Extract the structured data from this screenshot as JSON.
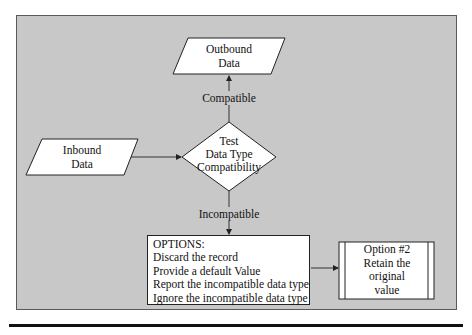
{
  "diagram": {
    "nodes": {
      "outbound": {
        "type": "data-io",
        "lines": [
          "Outbound",
          "Data"
        ]
      },
      "inbound": {
        "type": "data-io",
        "lines": [
          "Inbound",
          "Data"
        ]
      },
      "decision": {
        "type": "decision",
        "lines": [
          "Test",
          "Data Type",
          "Compatibility"
        ]
      },
      "options": {
        "type": "process",
        "title": "OPTIONS:",
        "items": [
          "Discard the record",
          "Provide a default Value",
          "Report the incompatible data type",
          "Ignore the incompatible data type"
        ]
      },
      "option2": {
        "type": "predefined-process",
        "lines": [
          "Option #2",
          "Retain the",
          "original",
          "value"
        ]
      }
    },
    "edges": {
      "compatible": {
        "from": "decision",
        "to": "outbound",
        "label": "Compatible"
      },
      "incompatible": {
        "from": "decision",
        "to": "options",
        "label": "Incompatible"
      },
      "inbound_to_decision": {
        "from": "inbound",
        "to": "decision",
        "label": ""
      },
      "options_to_option2": {
        "from": "options",
        "to": "option2",
        "label": ""
      }
    },
    "colors": {
      "background": "#c8c8c8",
      "shape_fill": "#ffffff",
      "stroke": "#222222"
    }
  }
}
